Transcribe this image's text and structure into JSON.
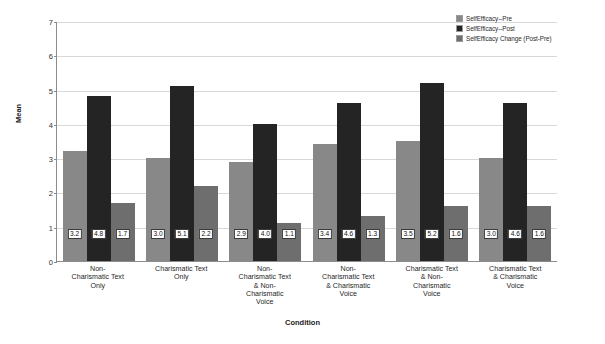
{
  "chart_data": {
    "type": "bar",
    "title": "",
    "xlabel": "Condition",
    "ylabel": "Mean",
    "ylim": [
      0,
      7
    ],
    "yticks": [
      0,
      1,
      2,
      3,
      4,
      5,
      6,
      7
    ],
    "grid": true,
    "legend_position": "top-right",
    "categories": [
      "Non-\nCharismatic Text\nOnly",
      "Charismatic Text\nOnly",
      "Non-\nCharismatic Text\n& Non-\nCharismatic\nVoice",
      "Non-\nCharismatic Text\n& Charismatic\nVoice",
      "Charismatic Text\n& Non-\nCharismatic\nVoice",
      "Charismatic Text\n& Charismatic\nVoice"
    ],
    "series": [
      {
        "name": "SelfEfficacy--Pre",
        "color": "#888888",
        "values": [
          3.2,
          3.0,
          2.9,
          3.4,
          3.5,
          3.0
        ],
        "labels": [
          "3.2",
          "3.0",
          "2.9",
          "3.4",
          "3.5",
          "3.0"
        ]
      },
      {
        "name": "SelfEfficacy--Post",
        "color": "#242424",
        "values": [
          4.8,
          5.1,
          4.0,
          4.6,
          5.2,
          4.6
        ],
        "labels": [
          "4.8",
          "5.1",
          "4.0",
          "4.6",
          "5.2",
          "4.6"
        ]
      },
      {
        "name": "SelfEfficacy Change (Post-Pre)",
        "color": "#6e6e6e",
        "values": [
          1.7,
          2.2,
          1.1,
          1.3,
          1.6,
          1.6
        ],
        "labels": [
          "1.7",
          "2.2",
          "1.1",
          "1.3",
          "1.6",
          "1.6"
        ]
      }
    ]
  }
}
